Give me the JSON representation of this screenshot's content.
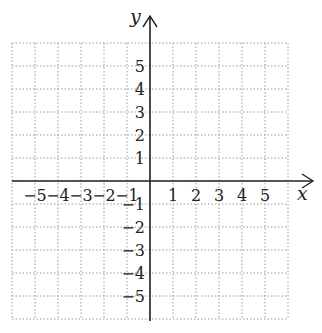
{
  "diagram": {
    "type": "cartesian-coordinate-grid",
    "x_axis": {
      "label": "x",
      "min": -6,
      "max": 6,
      "tick_labels": [
        "-5",
        "-4",
        "-3",
        "-2",
        "-1",
        "1",
        "2",
        "3",
        "4",
        "5"
      ]
    },
    "y_axis": {
      "label": "y",
      "min": -6,
      "max": 6,
      "tick_labels": [
        "5",
        "4",
        "3",
        "2",
        "1",
        "-1",
        "-2",
        "-3",
        "-4",
        "-5"
      ]
    },
    "grid": {
      "style": "dotted",
      "color": "#999999",
      "cells": 12
    },
    "axis_color": "#222222"
  },
  "labels": {
    "x_axis": "x",
    "y_axis": "y",
    "x_neg": [
      "−5",
      "−4",
      "−3",
      "−2",
      "−1"
    ],
    "x_pos": [
      "1",
      "2",
      "3",
      "4",
      "5"
    ],
    "y_pos": [
      "5",
      "4",
      "3",
      "2",
      "1"
    ],
    "y_neg": [
      "−1",
      "−2",
      "−3",
      "−4",
      "−5"
    ]
  }
}
